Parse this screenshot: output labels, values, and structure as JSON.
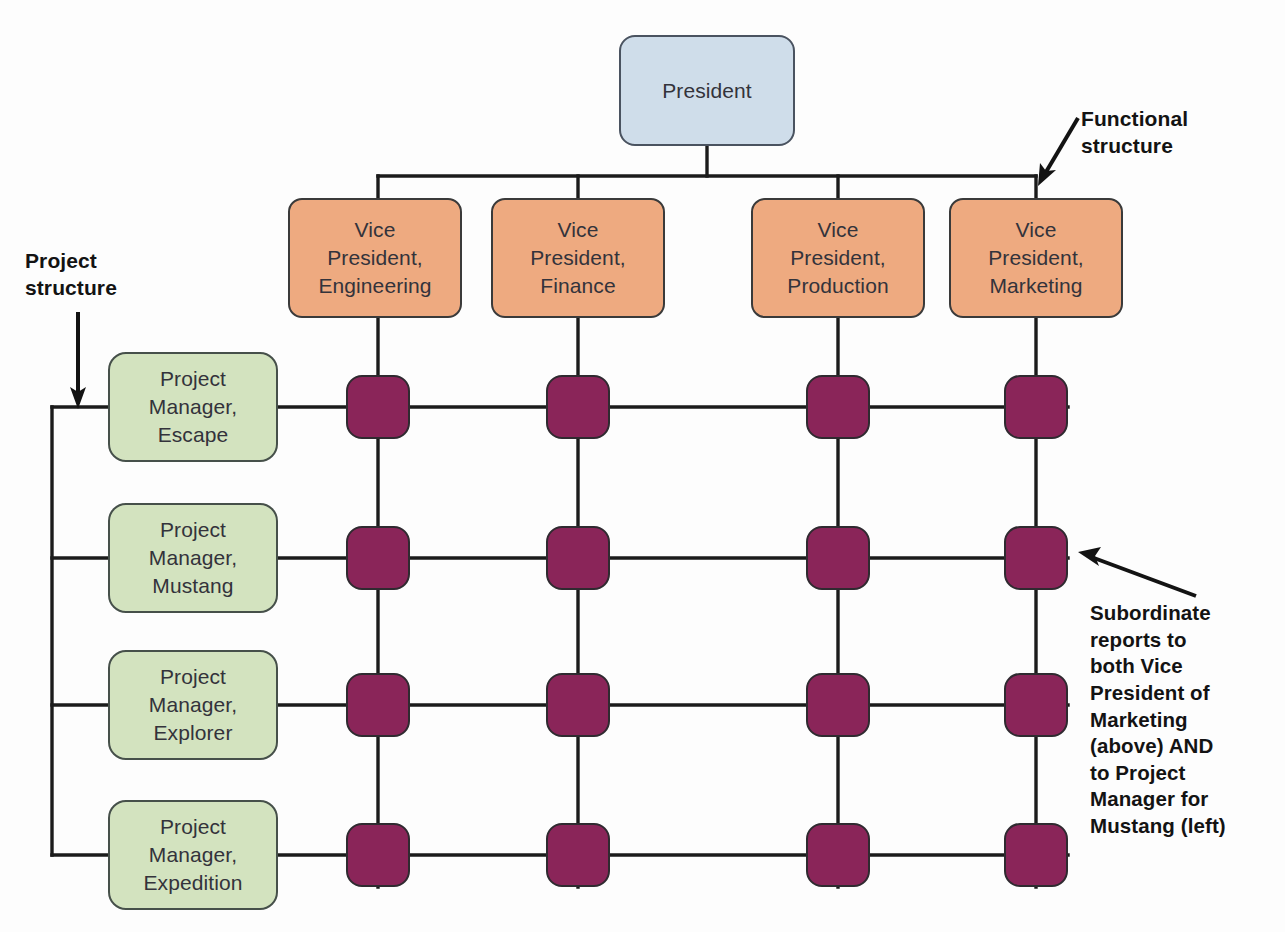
{
  "diagram": {
    "type": "matrix-organizational-chart",
    "top": {
      "label": "President",
      "color": "#cfddea"
    },
    "functional_color": "#eeaa80",
    "project_color": "#d3e3bf",
    "cell_color": "#8a2559",
    "line_color": "#1b1b1b",
    "columns": [
      {
        "line1": "Vice",
        "line2": "President,",
        "line3": "Engineering"
      },
      {
        "line1": "Vice",
        "line2": "President,",
        "line3": "Finance"
      },
      {
        "line1": "Vice",
        "line2": "President,",
        "line3": "Production"
      },
      {
        "line1": "Vice",
        "line2": "President,",
        "line3": "Marketing"
      }
    ],
    "rows": [
      {
        "line1": "Project",
        "line2": "Manager,",
        "line3": "Escape"
      },
      {
        "line1": "Project",
        "line2": "Manager,",
        "line3": "Mustang"
      },
      {
        "line1": "Project",
        "line2": "Manager,",
        "line3": "Explorer"
      },
      {
        "line1": "Project",
        "line2": "Manager,",
        "line3": "Expedition"
      }
    ],
    "cells": [
      [
        "Engineering/Escape",
        "Finance/Escape",
        "Production/Escape",
        "Marketing/Escape"
      ],
      [
        "Engineering/Mustang",
        "Finance/Mustang",
        "Production/Mustang",
        "Marketing/Mustang"
      ],
      [
        "Engineering/Explorer",
        "Finance/Explorer",
        "Production/Explorer",
        "Marketing/Explorer"
      ],
      [
        "Engineering/Expedition",
        "Finance/Expedition",
        "Production/Expedition",
        "Marketing/Expedition"
      ]
    ],
    "callouts": {
      "functional": {
        "line1": "Functional",
        "line2": "structure"
      },
      "project": {
        "line1": "Project",
        "line2": "structure"
      },
      "subordinate": {
        "line1": "Subordinate",
        "line2": "reports to",
        "line3": "both Vice",
        "line4": "President of",
        "line5": "Marketing",
        "line6": "(above) AND",
        "line7": "to Project",
        "line8": "Manager for",
        "line9": "Mustang (left)"
      }
    }
  }
}
